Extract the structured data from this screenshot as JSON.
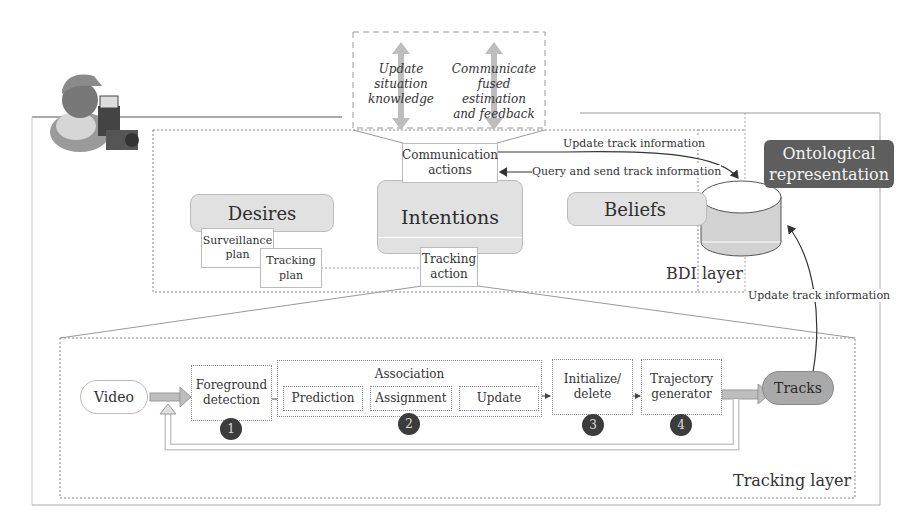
{
  "top_panel": {
    "left_text": [
      "Update",
      "situation",
      "knowledge"
    ],
    "right_text": [
      "Communicate",
      "fused estimation",
      "and feedback"
    ]
  },
  "bdi_layer": {
    "label": "BDI layer",
    "desires": {
      "title": "Desires",
      "surveillance_plan": [
        "Surveillance",
        "plan"
      ],
      "tracking_plan": "Tracking plan"
    },
    "intentions": {
      "title": "Intentions",
      "communication_actions": [
        "Communication",
        "actions"
      ],
      "tracking_action": [
        "Tracking",
        "action"
      ]
    },
    "beliefs": {
      "title": "Beliefs"
    },
    "arrows": {
      "update_track": "Update track information",
      "query_send": "Query and send track information"
    }
  },
  "ontology": {
    "label": [
      "Ontological",
      "representation"
    ]
  },
  "side_arrow": {
    "label": "Update track information"
  },
  "tracking_layer": {
    "label": "Tracking layer",
    "video": "Video",
    "foreground": [
      "Foreground",
      "detection"
    ],
    "association": {
      "title": "Association",
      "items": [
        "Prediction",
        "Assignment",
        "Update"
      ]
    },
    "initialize": [
      "Initialize/",
      "delete"
    ],
    "trajectory": [
      "Trajectory",
      "generator"
    ],
    "tracks": "Tracks",
    "steps": [
      "1",
      "2",
      "3",
      "4"
    ]
  },
  "colors": {
    "ontology_bg": "#5e5e5e",
    "pill_bg": "#e1e1e1",
    "tracks_bg": "#a9a9a9",
    "step_circle": "#3c3c3c",
    "arrow_fill": "#bdbdbd"
  }
}
